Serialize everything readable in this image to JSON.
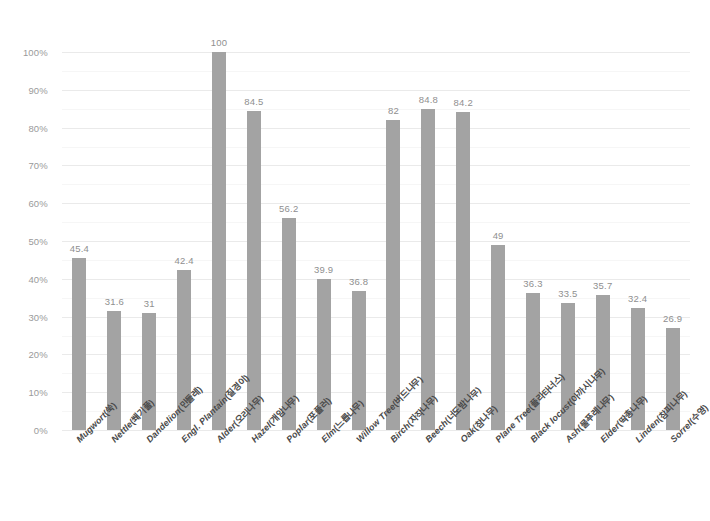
{
  "chart_data": {
    "type": "bar",
    "title": "",
    "subtitle": "",
    "xlabel": "",
    "ylabel": "",
    "ylim": [
      0,
      100
    ],
    "ytick_step": 10,
    "minor_gridline_step": 5,
    "grid": true,
    "legend": "none",
    "value_labels": true,
    "bar_color": "#a3a3a3",
    "gridline_color": "#eeeeee",
    "axis_text_color": "#9a9a9a",
    "category_text_color": "#4a4a4a",
    "ytick_labels": [
      "0%",
      "10%",
      "20%",
      "30%",
      "40%",
      "50%",
      "60%",
      "70%",
      "80%",
      "90%",
      "100%"
    ],
    "ytick_values": [
      0,
      10,
      20,
      30,
      40,
      50,
      60,
      70,
      80,
      90,
      100
    ],
    "categories": [
      "Mugwort(쑥)",
      "Nettle(쐐기풀)",
      "Dandelion(민들레)",
      "Engl. Plantain(질경이)",
      "Alder(오리나무)",
      "Hazel(개암나무)",
      "Poplar(포플러)",
      "Elm(느릅나무)",
      "Willow Tree(버드나무)",
      "Birch(자작나무)",
      "Beech(너도밤나무)",
      "Oak(참나무)",
      "Plane Tree(플라타너스)",
      "Black locust(아까시나무)",
      "Ash(물푸레나무)",
      "Elder(딱총나무)",
      "Linden(참피나무)",
      "Sorrel(수영)"
    ],
    "category_names_en": [
      "Mugwort",
      "Nettle",
      "Dandelion",
      "Engl. Plantain",
      "Alder",
      "Hazel",
      "Poplar",
      "Elm",
      "Willow Tree",
      "Birch",
      "Beech",
      "Oak",
      "Plane Tree",
      "Black locust",
      "Ash",
      "Elder",
      "Linden",
      "Sorrel"
    ],
    "category_names_ko": [
      "(쑥)",
      "(쐐기풀)",
      "(민들레)",
      "(질경이)",
      "(오리나무)",
      "(개암나무)",
      "(포플러)",
      "(느릅나무)",
      "(버드나무)",
      "(자작나무)",
      "(너도밤나무)",
      "(참나무)",
      "(플라타너스)",
      "(아까시나무)",
      "(물푸레나무)",
      "(딱총나무)",
      "(참피나무)",
      "(수영)"
    ],
    "values": [
      45.4,
      31.6,
      31,
      42.4,
      100,
      84.5,
      56.2,
      39.9,
      36.8,
      82,
      84.8,
      84.2,
      49,
      36.3,
      33.5,
      35.7,
      32.4,
      26.9
    ],
    "value_label_texts": [
      "45.4",
      "31.6",
      "31",
      "42.4",
      "100",
      "84.5",
      "56.2",
      "39.9",
      "36.8",
      "82",
      "84.8",
      "84.2",
      "49",
      "36.3",
      "33.5",
      "35.7",
      "32.4",
      "26.9"
    ]
  }
}
